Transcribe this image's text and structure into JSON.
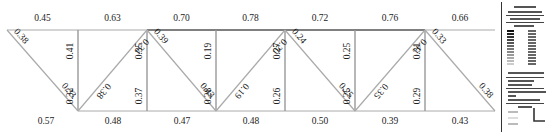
{
  "diagram": {
    "type": "truss-stress-ratio",
    "top_chord": [
      "0.45",
      "0.63",
      "0.70",
      "0.78",
      "0.72",
      "0.76",
      "0.66"
    ],
    "bottom_chord": [
      "0.57",
      "0.48",
      "0.47",
      "0.48",
      "0.50",
      "0.39",
      "0.43"
    ],
    "verticals": [
      {
        "top": "0.41",
        "bottom": "0.32"
      },
      {
        "top": "0.35",
        "bottom": "0.37"
      },
      {
        "top": "0.19",
        "bottom": "0.28"
      },
      {
        "top": "0.27",
        "bottom": "0.26"
      },
      {
        "top": "0.25",
        "bottom": "0.25"
      },
      {
        "top": "0.31",
        "bottom": "0.29"
      }
    ],
    "diagonals": [
      {
        "top": "0.38",
        "bottom": "0.33"
      },
      {
        "top": "0.34",
        "bottom": "0.38"
      },
      {
        "top": "0.39",
        "bottom": "0.43"
      },
      {
        "top": "0.20",
        "bottom": "0.19"
      },
      {
        "top": "0.24",
        "bottom": "0.25"
      },
      {
        "top": "0.41",
        "bottom": "0.35"
      },
      {
        "top": "0.33",
        "bottom": "0.38"
      }
    ]
  },
  "legend": {
    "color_bar": [
      "#111111",
      "#222222",
      "#333333",
      "#444444",
      "#555555",
      "#666666",
      "#777777",
      "#888888",
      "#999999",
      "#aaaaaa",
      "#bbbbbb",
      "#cccccc"
    ]
  },
  "colors": {
    "member": "#9a9a9a",
    "chord_dark": "#444444",
    "text": "#222222"
  }
}
